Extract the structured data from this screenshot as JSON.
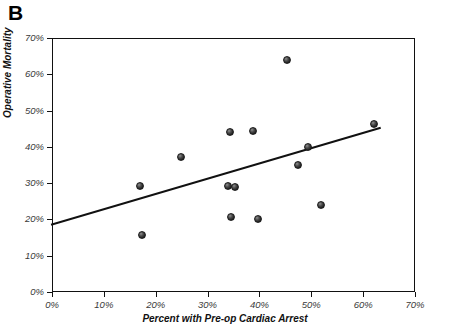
{
  "panel": {
    "label": "B"
  },
  "chart_data": {
    "type": "scatter",
    "title": "",
    "xlabel": "Percent with Pre-op Cardiac Arrest",
    "ylabel": "Operative Mortality",
    "xlim": [
      0,
      70
    ],
    "ylim": [
      0,
      70
    ],
    "grid": false,
    "legend": null,
    "x_tick_labels": [
      "0%",
      "10%",
      "20%",
      "30%",
      "40%",
      "50%",
      "60%",
      "70%"
    ],
    "x_ticks": [
      0,
      10,
      20,
      30,
      40,
      50,
      60,
      70
    ],
    "y_tick_labels": [
      "0%",
      "10%",
      "20%",
      "30%",
      "40%",
      "50%",
      "60%",
      "70%"
    ],
    "y_ticks": [
      0,
      10,
      20,
      30,
      40,
      50,
      60,
      70
    ],
    "points": [
      {
        "x": 17.0,
        "y": 29.3
      },
      {
        "x": 17.3,
        "y": 15.8
      },
      {
        "x": 24.8,
        "y": 37.3
      },
      {
        "x": 34.0,
        "y": 29.2
      },
      {
        "x": 35.3,
        "y": 29.0
      },
      {
        "x": 34.4,
        "y": 44.0
      },
      {
        "x": 34.6,
        "y": 20.6
      },
      {
        "x": 38.7,
        "y": 44.3
      },
      {
        "x": 39.8,
        "y": 20.0
      },
      {
        "x": 45.3,
        "y": 64.0
      },
      {
        "x": 47.4,
        "y": 35.0
      },
      {
        "x": 49.4,
        "y": 40.0
      },
      {
        "x": 51.8,
        "y": 24.0
      },
      {
        "x": 62.0,
        "y": 46.3
      }
    ],
    "trendline": {
      "type": "linear",
      "x_start": 0.0,
      "y_start": 18.6,
      "x_end": 63.2,
      "y_end": 45.2
    }
  }
}
